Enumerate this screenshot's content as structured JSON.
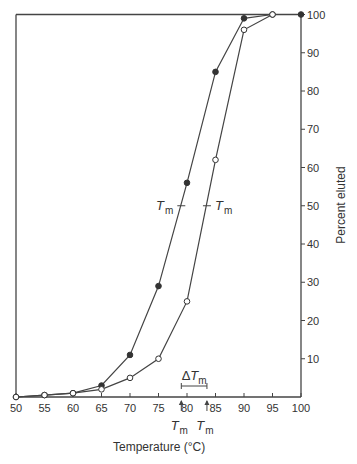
{
  "chart_data": {
    "type": "line",
    "title": "",
    "xlabel": "Temperature (°C)",
    "ylabel": "Percent eluted",
    "xlim": [
      50,
      100
    ],
    "ylim": [
      0,
      100
    ],
    "x_ticks": [
      50,
      55,
      60,
      65,
      70,
      75,
      80,
      85,
      90,
      95,
      100
    ],
    "y_ticks": [
      10,
      20,
      30,
      40,
      50,
      60,
      70,
      80,
      90,
      100
    ],
    "y_axis_position": "right",
    "grid": false,
    "series": [
      {
        "name": "filled circles",
        "marker": "filled-circle",
        "x": [
          50,
          55,
          60,
          65,
          70,
          75,
          80,
          85,
          90,
          95,
          100
        ],
        "y": [
          0,
          0.5,
          1,
          3,
          11,
          29,
          56,
          85,
          99,
          100,
          100
        ]
      },
      {
        "name": "open circles",
        "marker": "open-circle",
        "x": [
          50,
          55,
          60,
          65,
          70,
          75,
          80,
          85,
          90,
          95
        ],
        "y": [
          0,
          0.5,
          1,
          2,
          5,
          10,
          25,
          62,
          96,
          100
        ]
      }
    ],
    "annotations": [
      {
        "text": "T",
        "subscript": "m",
        "x": 79,
        "y": 50,
        "side": "left"
      },
      {
        "text": "T",
        "subscript": "m",
        "x": 83.5,
        "y": 50,
        "side": "right"
      },
      {
        "text": "ΔT",
        "subscript": "m",
        "x_from": 79,
        "x_to": 83.5,
        "y": 3.5
      },
      {
        "text": "T",
        "subscript": "m",
        "arrow_at_x": 79,
        "position": "below-axis"
      },
      {
        "text": "T",
        "subscript": "m",
        "arrow_at_x": 83.5,
        "position": "below-axis"
      }
    ]
  },
  "labels": {
    "xlabel": "Temperature (°C)",
    "ylabel": "Percent eluted",
    "tm": "T",
    "tm_sub": "m",
    "delta_tm": "ΔT",
    "x_ticks": [
      "50",
      "55",
      "60",
      "65",
      "70",
      "75",
      "80",
      "85",
      "90",
      "95",
      "100"
    ],
    "y_ticks": [
      "10",
      "20",
      "30",
      "40",
      "50",
      "60",
      "70",
      "80",
      "90",
      "100"
    ]
  }
}
